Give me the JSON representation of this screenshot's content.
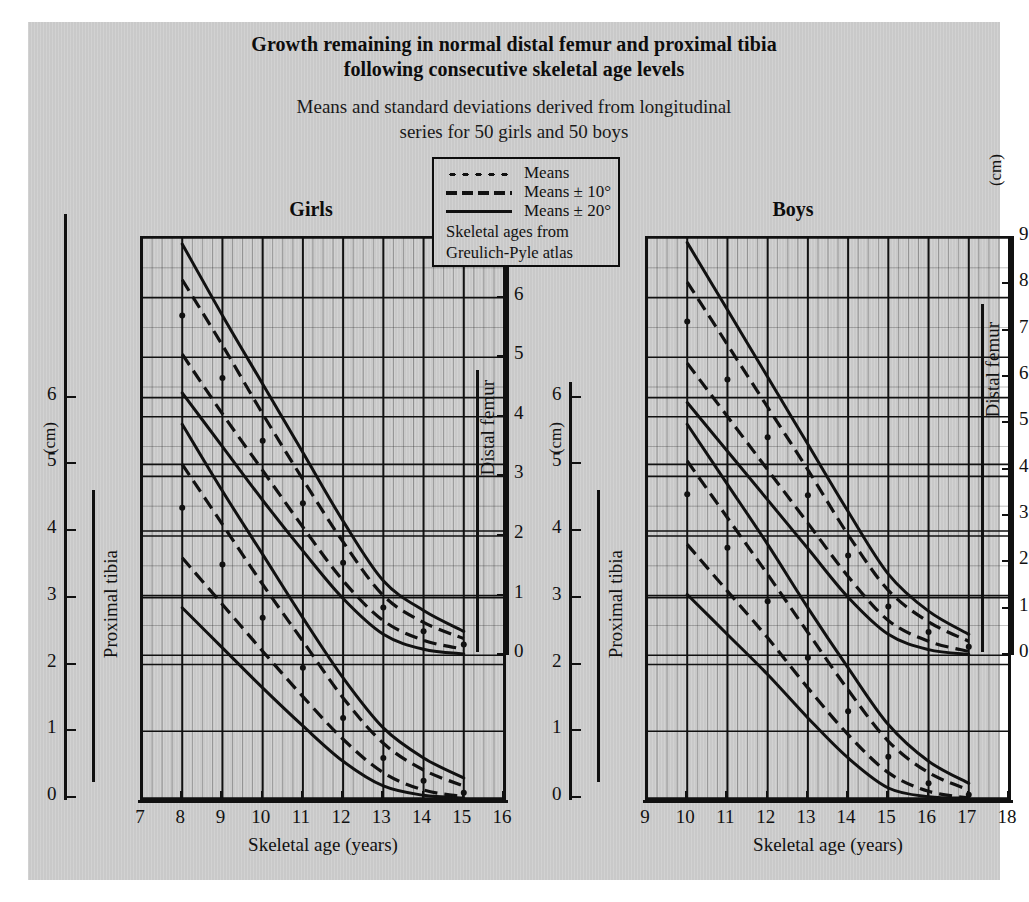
{
  "title": "Growth remaining in normal distal femur and proximal tibia following consecutive skeletal age levels",
  "title_line1": "Growth remaining in normal distal femur and proximal tibia",
  "title_line2": "following consecutive skeletal age levels",
  "subtitle_line1": "Means and standard deviations derived from longitudinal",
  "subtitle_line2": "series for 50 girls and 50 boys",
  "legend": {
    "items": [
      {
        "style": "dotted",
        "label": "Means"
      },
      {
        "style": "dashed",
        "label": "Means ± 10°"
      },
      {
        "style": "solid",
        "label": "Means ± 20°"
      }
    ],
    "note_line1": "Skeletal ages from",
    "note_line2": "Greulich-Pyle atlas"
  },
  "colors": {
    "page_background": "#c9c9c9",
    "ink": "#111111",
    "outer_margin": "#ffffff"
  },
  "panels": [
    {
      "name": "Girls",
      "heading": "Girls",
      "xlabel": "Skeletal age (years)",
      "xticks": [
        7,
        8,
        9,
        10,
        11,
        12,
        13,
        14,
        15,
        16
      ],
      "left_axis": {
        "unit": "(cm)",
        "group": "Proximal tibia",
        "ticks": [
          0,
          1,
          2,
          3,
          4,
          5,
          6
        ]
      },
      "right_axis": {
        "unit": "",
        "group": "Distal femur",
        "ticks": [
          0,
          1,
          2,
          3,
          4,
          5,
          6,
          7
        ]
      }
    },
    {
      "name": "Boys",
      "heading": "Boys",
      "xlabel": "Skeletal age (years)",
      "xticks": [
        9,
        10,
        11,
        12,
        13,
        14,
        15,
        16,
        17,
        18
      ],
      "left_axis": {
        "unit": "(cm)",
        "group": "Proximal tibia",
        "ticks": [
          0,
          1,
          2,
          3,
          4,
          5,
          6
        ]
      },
      "right_axis": {
        "unit": "(cm)",
        "group": "Distal femur",
        "ticks": [
          0,
          1,
          2,
          3,
          4,
          5,
          6,
          7,
          8,
          9
        ]
      }
    }
  ],
  "chart_data": {
    "type": "line",
    "title": "Growth remaining in normal distal femur and proximal tibia following consecutive skeletal age levels",
    "xlabel": "Skeletal age (years)",
    "ylabel": "Growth remaining (cm)",
    "grid": true,
    "legend_position": "top-center",
    "panels": [
      {
        "name": "Girls",
        "xlim": [
          7,
          16
        ],
        "bones": [
          {
            "bone": "Distal femur",
            "ylim": [
              0,
              7
            ],
            "x": [
              8,
              9,
              10,
              11,
              12,
              13,
              14,
              15
            ],
            "series": [
              {
                "name": "Means + 20°",
                "style": "solid",
                "values": [
                  6.9,
                  5.7,
                  4.55,
                  3.4,
                  2.25,
                  1.25,
                  0.75,
                  0.4
                ]
              },
              {
                "name": "Means + 10°",
                "style": "dashed",
                "values": [
                  6.3,
                  5.2,
                  4.05,
                  2.95,
                  1.9,
                  1.0,
                  0.55,
                  0.28
                ]
              },
              {
                "name": "Means",
                "style": "dotted",
                "values": [
                  5.7,
                  4.65,
                  3.6,
                  2.55,
                  1.55,
                  0.8,
                  0.4,
                  0.18
                ]
              },
              {
                "name": "Means - 10°",
                "style": "dashed",
                "values": [
                  5.05,
                  4.05,
                  3.1,
                  2.15,
                  1.25,
                  0.58,
                  0.25,
                  0.1
                ]
              },
              {
                "name": "Means - 20°",
                "style": "solid",
                "values": [
                  4.4,
                  3.5,
                  2.6,
                  1.75,
                  0.95,
                  0.35,
                  0.1,
                  0.02
                ]
              }
            ]
          },
          {
            "bone": "Proximal tibia",
            "ylim": [
              0,
              6
            ],
            "x": [
              8,
              9,
              10,
              11,
              12,
              13,
              14,
              15
            ],
            "series": [
              {
                "name": "Means + 20°",
                "style": "solid",
                "values": [
                  5.6,
                  4.6,
                  3.65,
                  2.7,
                  1.8,
                  1.05,
                  0.6,
                  0.3
                ]
              },
              {
                "name": "Means + 10°",
                "style": "dashed",
                "values": [
                  5.0,
                  4.1,
                  3.2,
                  2.35,
                  1.5,
                  0.82,
                  0.42,
                  0.18
                ]
              },
              {
                "name": "Means",
                "style": "dotted",
                "values": [
                  4.35,
                  3.5,
                  2.7,
                  1.95,
                  1.2,
                  0.6,
                  0.26,
                  0.08
                ]
              },
              {
                "name": "Means - 10°",
                "style": "dashed",
                "values": [
                  3.6,
                  2.9,
                  2.2,
                  1.52,
                  0.88,
                  0.38,
                  0.12,
                  0.02
                ]
              },
              {
                "name": "Means - 20°",
                "style": "solid",
                "values": [
                  2.85,
                  2.25,
                  1.65,
                  1.08,
                  0.55,
                  0.18,
                  0.04,
                  0.0
                ]
              }
            ]
          }
        ]
      },
      {
        "name": "Boys",
        "xlim": [
          9,
          18
        ],
        "bones": [
          {
            "bone": "Distal femur",
            "ylim": [
              0,
              9
            ],
            "x": [
              10,
              11,
              12,
              13,
              14,
              15,
              16,
              17
            ],
            "series": [
              {
                "name": "Means + 20°",
                "style": "solid",
                "values": [
                  8.9,
                  7.45,
                  6.0,
                  4.55,
                  3.1,
                  1.75,
                  0.95,
                  0.45
                ]
              },
              {
                "name": "Means + 10°",
                "style": "dashed",
                "values": [
                  8.05,
                  6.7,
                  5.35,
                  4.0,
                  2.6,
                  1.4,
                  0.72,
                  0.3
                ]
              },
              {
                "name": "Means",
                "style": "dotted",
                "values": [
                  7.2,
                  5.95,
                  4.7,
                  3.45,
                  2.15,
                  1.05,
                  0.5,
                  0.18
                ]
              },
              {
                "name": "Means - 10°",
                "style": "dashed",
                "values": [
                  6.3,
                  5.15,
                  4.0,
                  2.85,
                  1.7,
                  0.75,
                  0.3,
                  0.08
                ]
              },
              {
                "name": "Means - 20°",
                "style": "solid",
                "values": [
                  5.45,
                  4.4,
                  3.35,
                  2.3,
                  1.25,
                  0.45,
                  0.12,
                  0.02
                ]
              }
            ]
          },
          {
            "bone": "Proximal tibia",
            "ylim": [
              0,
              6
            ],
            "x": [
              10,
              11,
              12,
              13,
              14,
              15,
              16,
              17
            ],
            "series": [
              {
                "name": "Means + 20°",
                "style": "solid",
                "values": [
                  5.6,
                  4.7,
                  3.8,
                  2.85,
                  1.95,
                  1.1,
                  0.55,
                  0.22
                ]
              },
              {
                "name": "Means + 10°",
                "style": "dashed",
                "values": [
                  5.05,
                  4.2,
                  3.35,
                  2.48,
                  1.62,
                  0.85,
                  0.38,
                  0.12
                ]
              },
              {
                "name": "Means",
                "style": "dotted",
                "values": [
                  4.55,
                  3.75,
                  2.95,
                  2.1,
                  1.3,
                  0.62,
                  0.22,
                  0.05
                ]
              },
              {
                "name": "Means - 10°",
                "style": "dashed",
                "values": [
                  3.8,
                  3.1,
                  2.4,
                  1.65,
                  0.95,
                  0.38,
                  0.1,
                  0.0
                ]
              },
              {
                "name": "Means - 20°",
                "style": "solid",
                "values": [
                  3.05,
                  2.45,
                  1.85,
                  1.2,
                  0.6,
                  0.15,
                  0.02,
                  0.0
                ]
              }
            ]
          }
        ]
      }
    ]
  }
}
